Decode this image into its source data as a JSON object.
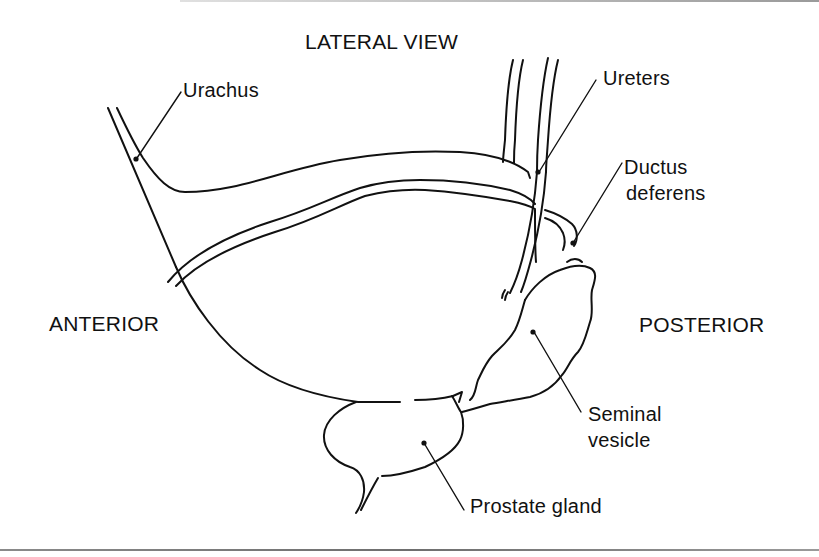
{
  "diagram": {
    "title": "LATERAL VIEW",
    "orientation": {
      "left": "ANTERIOR",
      "right": "POSTERIOR"
    },
    "labels": {
      "urachus": "Urachus",
      "ureters": "Ureters",
      "ductus_line1": "Ductus",
      "ductus_line2": "deferens",
      "seminal_line1": "Seminal",
      "seminal_line2": "vesicle",
      "prostate": "Prostate gland"
    },
    "colors": {
      "ink": "#111111",
      "background": "#ffffff"
    }
  }
}
